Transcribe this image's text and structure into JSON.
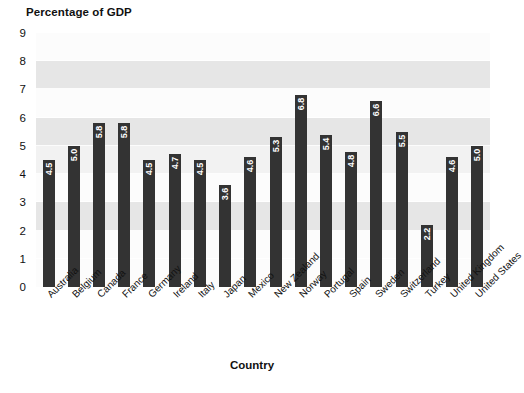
{
  "chart_data": {
    "type": "bar",
    "title": "",
    "ylabel": "Percentage of GDP",
    "xlabel": "Country",
    "ylim": [
      0,
      9
    ],
    "yticks": [
      "0",
      "1",
      "2",
      "3",
      "4",
      "5",
      "6",
      "7",
      "8",
      "9"
    ],
    "grid": true,
    "legend": null,
    "bar_color": "#333333",
    "value_label_color": "#ffffff",
    "band_color_light": "#fcfcfc",
    "band_color_dark": "#e6e6e6",
    "plot_background": "#fbfbfb",
    "categories": [
      "Australia",
      "Belgium",
      "Canada",
      "France",
      "Germany",
      "Ireland",
      "Italy",
      "Japan",
      "Mexico",
      "New Zealand",
      "Norway",
      "Portugal",
      "Spain",
      "Sweden",
      "Switzerland",
      "Turkey",
      "United Kingdom",
      "United States"
    ],
    "values": [
      4.5,
      5.0,
      5.8,
      5.8,
      4.5,
      4.7,
      4.5,
      3.6,
      4.6,
      5.3,
      6.8,
      5.4,
      4.8,
      6.6,
      5.5,
      2.2,
      4.6,
      5.0
    ],
    "value_labels": [
      "4.5",
      "5.0",
      "5.8",
      "5.8",
      "4.5",
      "4.7",
      "4.5",
      "3.6",
      "4.6",
      "5.3",
      "6.8",
      "5.4",
      "4.8",
      "6.6",
      "5.5",
      "2.2",
      "4.6",
      "5.0"
    ]
  }
}
